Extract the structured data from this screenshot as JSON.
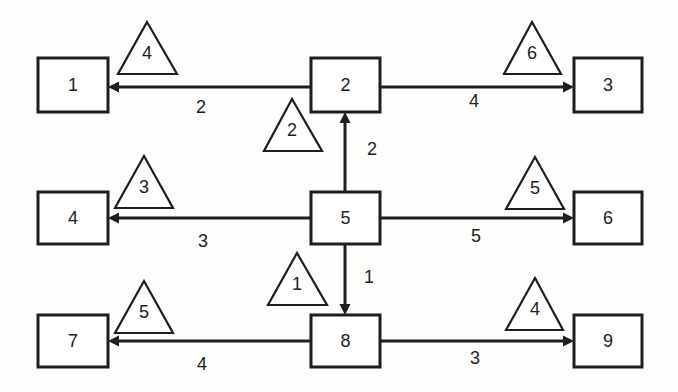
{
  "diagram": {
    "nodes": [
      {
        "id": "1",
        "label": "1",
        "x": 38,
        "y": 58,
        "w": 70,
        "h": 54
      },
      {
        "id": "2",
        "label": "2",
        "x": 311,
        "y": 58,
        "w": 69,
        "h": 54
      },
      {
        "id": "3",
        "label": "3",
        "x": 574,
        "y": 58,
        "w": 68,
        "h": 54
      },
      {
        "id": "4",
        "label": "4",
        "x": 38,
        "y": 192,
        "w": 70,
        "h": 52
      },
      {
        "id": "5",
        "label": "5",
        "x": 311,
        "y": 192,
        "w": 69,
        "h": 52
      },
      {
        "id": "6",
        "label": "6",
        "x": 574,
        "y": 192,
        "w": 68,
        "h": 52
      },
      {
        "id": "7",
        "label": "7",
        "x": 38,
        "y": 315,
        "w": 70,
        "h": 52
      },
      {
        "id": "8",
        "label": "8",
        "x": 311,
        "y": 315,
        "w": 69,
        "h": 52
      },
      {
        "id": "9",
        "label": "9",
        "x": 574,
        "y": 315,
        "w": 68,
        "h": 52
      }
    ],
    "edges": [
      {
        "from": "2",
        "to": "1",
        "label": "2",
        "x1": 311,
        "y1": 87,
        "x2": 108,
        "y2": 87,
        "lx": 201,
        "ly": 107
      },
      {
        "from": "2",
        "to": "3",
        "label": "4",
        "x1": 380,
        "y1": 87,
        "x2": 574,
        "y2": 87,
        "lx": 474,
        "ly": 101
      },
      {
        "from": "5",
        "to": "2",
        "label": "2",
        "x1": 345,
        "y1": 192,
        "x2": 345,
        "y2": 112,
        "lx": 372,
        "ly": 149
      },
      {
        "from": "5",
        "to": "4",
        "label": "3",
        "x1": 311,
        "y1": 218,
        "x2": 108,
        "y2": 218,
        "lx": 203,
        "ly": 241
      },
      {
        "from": "5",
        "to": "6",
        "label": "5",
        "x1": 380,
        "y1": 218,
        "x2": 574,
        "y2": 218,
        "lx": 476,
        "ly": 236
      },
      {
        "from": "5",
        "to": "8",
        "label": "1",
        "x1": 345,
        "y1": 244,
        "x2": 345,
        "y2": 315,
        "lx": 369,
        "ly": 277
      },
      {
        "from": "8",
        "to": "7",
        "label": "4",
        "x1": 311,
        "y1": 341,
        "x2": 108,
        "y2": 341,
        "lx": 202,
        "ly": 364
      },
      {
        "from": "8",
        "to": "9",
        "label": "3",
        "x1": 380,
        "y1": 341,
        "x2": 574,
        "y2": 341,
        "lx": 475,
        "ly": 358
      }
    ],
    "triangles": [
      {
        "label": "4",
        "apex_x": 147,
        "apex_y": 22,
        "base_y": 74,
        "left_x": 118,
        "right_x": 177
      },
      {
        "label": "6",
        "apex_x": 532,
        "apex_y": 22,
        "base_y": 74,
        "left_x": 504,
        "right_x": 561
      },
      {
        "label": "2",
        "apex_x": 292,
        "apex_y": 99,
        "base_y": 151,
        "left_x": 264,
        "right_x": 322
      },
      {
        "label": "3",
        "apex_x": 144,
        "apex_y": 156,
        "base_y": 208,
        "left_x": 115,
        "right_x": 173
      },
      {
        "label": "5",
        "apex_x": 535,
        "apex_y": 157,
        "base_y": 209,
        "left_x": 506,
        "right_x": 564
      },
      {
        "label": "1",
        "apex_x": 297,
        "apex_y": 253,
        "base_y": 305,
        "left_x": 268,
        "right_x": 327
      },
      {
        "label": "5",
        "apex_x": 144,
        "apex_y": 281,
        "base_y": 333,
        "left_x": 115,
        "right_x": 173
      },
      {
        "label": "4",
        "apex_x": 535,
        "apex_y": 278,
        "base_y": 330,
        "left_x": 506,
        "right_x": 563
      }
    ],
    "colors": {
      "stroke": "#1e1e1e",
      "text": "#222222",
      "background": "#fdfdfb"
    }
  }
}
